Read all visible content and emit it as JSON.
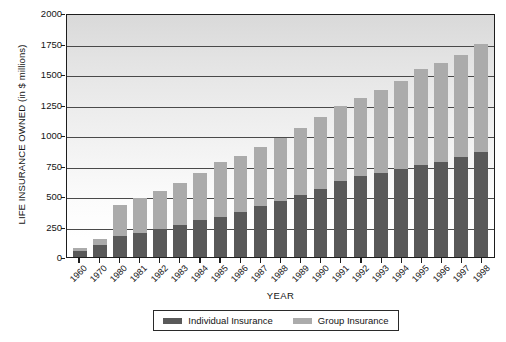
{
  "chart_data": {
    "type": "bar",
    "title": "",
    "stacked": true,
    "xlabel": "YEAR",
    "ylabel": "LIFE INSURANCE OWNED (in $ millions)",
    "ylim": [
      0,
      2000
    ],
    "yticks": [
      2000,
      1750,
      1500,
      1250,
      1000,
      750,
      500,
      250,
      0
    ],
    "grid": true,
    "legend_position": "bottom",
    "categories": [
      "1960",
      "1970",
      "1980",
      "1981",
      "1982",
      "1983",
      "1984",
      "1985",
      "1986",
      "1987",
      "1988",
      "1989",
      "1990",
      "1991",
      "1992",
      "1993",
      "1994",
      "1995",
      "1996",
      "1997",
      "1998"
    ],
    "series": [
      {
        "name": "Individual Insurance",
        "color": "#595959",
        "values": [
          50,
          95,
          175,
          200,
          230,
          260,
          300,
          330,
          370,
          415,
          460,
          505,
          555,
          620,
          660,
          690,
          720,
          755,
          780,
          820,
          860
        ]
      },
      {
        "name": "Group Insurance",
        "color": "#ababab",
        "values": [
          25,
          55,
          250,
          280,
          310,
          350,
          390,
          445,
          460,
          485,
          515,
          550,
          595,
          620,
          645,
          680,
          725,
          790,
          810,
          835,
          890
        ]
      }
    ],
    "totals": [
      75,
      150,
      425,
      480,
      540,
      610,
      690,
      775,
      830,
      900,
      975,
      1055,
      1150,
      1240,
      1305,
      1370,
      1445,
      1545,
      1590,
      1655,
      1750
    ]
  },
  "legend": {
    "items": [
      {
        "label": "Individual Insurance",
        "color": "#595959"
      },
      {
        "label": "Group Insurance",
        "color": "#ababab"
      }
    ]
  }
}
